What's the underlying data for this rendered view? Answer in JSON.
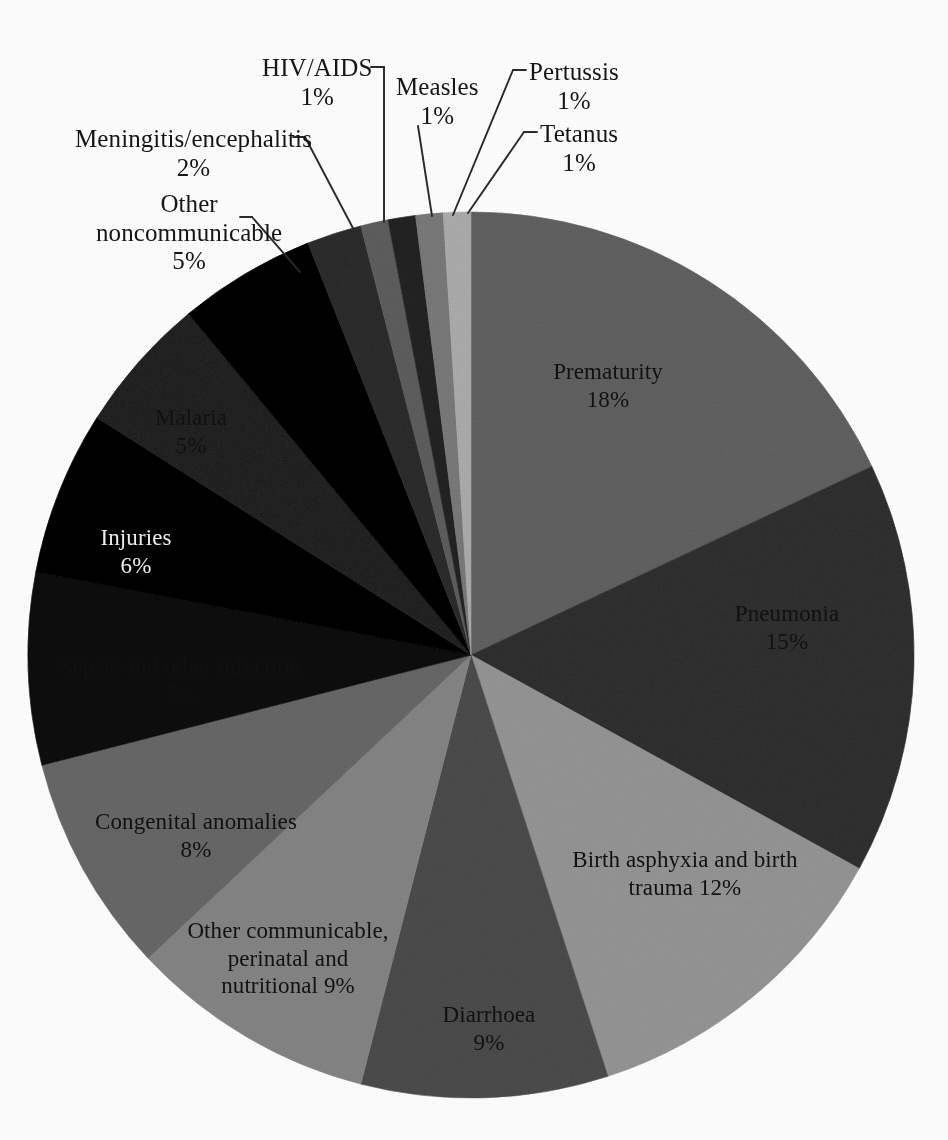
{
  "figure": {
    "kind": "pie-chart",
    "background": "#ffffff"
  },
  "chart_data": {
    "type": "pie",
    "title": "",
    "subtitle": "",
    "xlabel": "",
    "ylabel": "",
    "grid": false,
    "legend_position": "none",
    "start_angle_deg": -90,
    "direction": "clockwise",
    "center": {
      "x": 471,
      "y": 655
    },
    "radius": 443,
    "labels_inside": true,
    "value_suffix": "%",
    "categories": [
      "Prematurity",
      "Pneumonia",
      "Birth asphyxia and birth trauma",
      "Diarrhoea",
      "Other communicable, perinatal and nutritional",
      "Congenital anomalies",
      "Sepsis and other infection",
      "Injuries",
      "Malaria",
      "Other noncommunicable",
      "Meningitis/encephalitis",
      "HIV/AIDS",
      "Measles",
      "Pertussis",
      "Tetanus"
    ],
    "values": [
      18,
      15,
      12,
      9,
      9,
      8,
      7,
      6,
      5,
      5,
      2,
      1,
      1,
      1,
      1
    ],
    "colors": [
      "#9d9d9d",
      "#6e6e6e",
      "#c3c3c3",
      "#8a8a8a",
      "#b8b8b8",
      "#a2a2a2",
      "#3a3a3a",
      "#111111",
      "#5c5c5c",
      "#141414",
      "#6a6a6a",
      "#9a9a9a",
      "#5e5e5e",
      "#b0b0b0",
      "#d2d2d2"
    ]
  },
  "slice_labels": [
    {
      "name": "prematurity",
      "title": "Prematurity",
      "pct": "18%",
      "x": 608,
      "y": 358,
      "tone": "dark"
    },
    {
      "name": "pneumonia",
      "title": "Pneumonia",
      "pct": "15%",
      "x": 787,
      "y": 600,
      "tone": "dark"
    },
    {
      "name": "birth-asphyxia",
      "title": "Birth asphyxia and birth",
      "pct": "trauma 12%",
      "x": 685,
      "y": 846,
      "tone": "dark"
    },
    {
      "name": "diarrhoea",
      "title": "Diarrhoea",
      "pct": "9%",
      "x": 489,
      "y": 1001,
      "tone": "dark"
    },
    {
      "name": "other-communicable",
      "title": "Other communicable,",
      "pct": "perinatal and",
      "pct2": "nutritional 9%",
      "x": 288,
      "y": 917,
      "tone": "dark"
    },
    {
      "name": "congenital",
      "title": "Congenital anomalies",
      "pct": "8%",
      "x": 196,
      "y": 808,
      "tone": "dark"
    },
    {
      "name": "sepsis",
      "title": "Sepsis and other infection",
      "pct": "7%",
      "x": 180,
      "y": 653,
      "tone": "dark"
    },
    {
      "name": "injuries",
      "title": "Injuries",
      "pct": "6%",
      "x": 136,
      "y": 524,
      "tone": "light"
    },
    {
      "name": "malaria",
      "title": "Malaria",
      "pct": "5%",
      "x": 191,
      "y": 404,
      "tone": "dark"
    }
  ],
  "callouts": [
    {
      "name": "other-noncommunicable",
      "title": "Other",
      "line2": "noncommunicable",
      "pct": "5%",
      "text_x": 96,
      "text_y": 190,
      "dash_x1": 240,
      "dash_y1": 217,
      "dash_x2": 252,
      "dash_y2": 217,
      "leader": "M252,217 L300,272"
    },
    {
      "name": "meningitis-encephalitis",
      "title": "Meningitis/encephalitis",
      "pct": "2%",
      "text_x": 75,
      "text_y": 125,
      "dash_x1": 293,
      "dash_y1": 137,
      "dash_x2": 305,
      "dash_y2": 137,
      "leader": "M305,137 L355,232"
    },
    {
      "name": "hiv-aids",
      "title": "HIV/AIDS",
      "pct": "1%",
      "text_x": 262,
      "text_y": 54,
      "dash_x1": 371,
      "dash_y1": 67,
      "dash_x2": 384,
      "dash_y2": 67,
      "leader": "M384,67 L384,222"
    },
    {
      "name": "measles",
      "title": "Measles",
      "pct": "1%",
      "text_x": 396,
      "text_y": 73,
      "leader": "M418,126 L432,216"
    },
    {
      "name": "pertussis",
      "title": "Pertussis",
      "pct": "1%",
      "text_x": 529,
      "text_y": 58,
      "dash_x1": 513,
      "dash_y1": 70,
      "dash_x2": 526,
      "dash_y2": 70,
      "leader": "M513,70 L453,215"
    },
    {
      "name": "tetanus",
      "title": "Tetanus",
      "pct": "1%",
      "text_x": 540,
      "text_y": 120,
      "dash_x1": 524,
      "dash_y1": 132,
      "dash_x2": 537,
      "dash_y2": 132,
      "leader": "M524,132 L468,213"
    }
  ]
}
